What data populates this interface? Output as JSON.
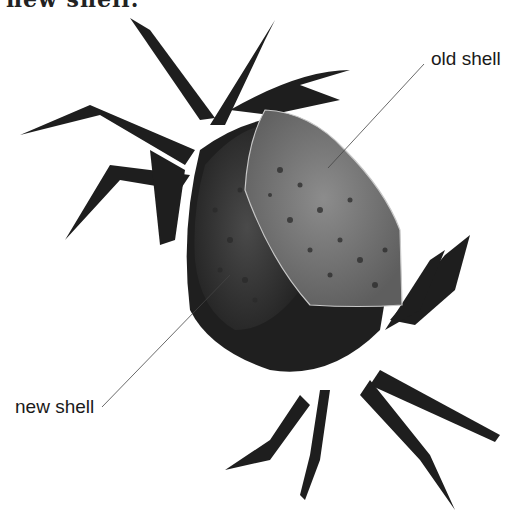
{
  "image": {
    "subject": "crab molting, shedding old shell",
    "caption_partial": "new shell.",
    "labels": [
      {
        "text": "old shell"
      },
      {
        "text": "new shell"
      }
    ],
    "colors": {
      "background": "#ffffff",
      "crab_dark": "#1c1c1c",
      "old_shell": "#7a7a7a",
      "new_shell": "#3a3a3a",
      "line": "#444444"
    }
  }
}
